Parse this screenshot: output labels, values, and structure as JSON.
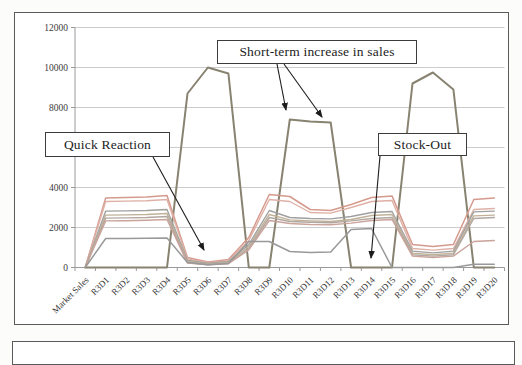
{
  "chart_data": {
    "type": "line",
    "title": "",
    "xlabel": "",
    "ylabel": "",
    "ylim": [
      0,
      12000
    ],
    "ytick_interval": 2000,
    "ytick_labels": [
      "0",
      "2000",
      "4000",
      "6000",
      "8000",
      "10000",
      "12000"
    ],
    "grid": "horizontal",
    "legend": "none",
    "categories": [
      "Market Sales",
      "R3D1",
      "R3D2",
      "R3D3",
      "R3D4",
      "R3D5",
      "R3D6",
      "R3D7",
      "R3D8",
      "R3D9",
      "R3D10",
      "R3D11",
      "R3D12",
      "R3D13",
      "R3D14",
      "R3D15",
      "R3D16",
      "R3D17",
      "R3D18",
      "R3D19",
      "R3D20"
    ],
    "series": [
      {
        "name": "promo-spike",
        "color": "#878370",
        "width": 2,
        "values": [
          0,
          0,
          0,
          0,
          0,
          8700,
          10000,
          9700,
          0,
          0,
          7400,
          7300,
          7250,
          0,
          0,
          0,
          9200,
          9750,
          8900,
          0,
          0
        ]
      },
      {
        "name": "top-salmon",
        "color": "#d59a8d",
        "width": 1.5,
        "values": [
          0,
          3480,
          3500,
          3530,
          3600,
          500,
          280,
          400,
          1500,
          3650,
          3550,
          2900,
          2850,
          3150,
          3500,
          3580,
          1150,
          1050,
          1150,
          3400,
          3480
        ]
      },
      {
        "name": "light-salmon",
        "color": "#dfb1a6",
        "width": 1.4,
        "values": [
          0,
          3300,
          3320,
          3340,
          3400,
          430,
          240,
          340,
          1350,
          3400,
          3300,
          2750,
          2720,
          3000,
          3300,
          3350,
          950,
          870,
          950,
          2900,
          2950
        ]
      },
      {
        "name": "gray-1",
        "color": "#a0a0a0",
        "width": 1.4,
        "values": [
          0,
          2820,
          2830,
          2850,
          2900,
          360,
          200,
          300,
          1150,
          2850,
          2500,
          2450,
          2430,
          2550,
          2750,
          2800,
          820,
          730,
          820,
          2780,
          2820
        ]
      },
      {
        "name": "tan-1",
        "color": "#c0b197",
        "width": 1.4,
        "values": [
          0,
          2620,
          2630,
          2650,
          2700,
          310,
          170,
          260,
          1050,
          2650,
          2380,
          2330,
          2300,
          2400,
          2600,
          2650,
          720,
          640,
          720,
          2580,
          2620
        ]
      },
      {
        "name": "warm-gray",
        "color": "#b2a7a0",
        "width": 1.4,
        "values": [
          0,
          2470,
          2480,
          2500,
          2550,
          260,
          150,
          220,
          950,
          2500,
          2300,
          2260,
          2240,
          2330,
          2450,
          2500,
          640,
          570,
          640,
          2450,
          2500
        ]
      },
      {
        "name": "pink-2",
        "color": "#caa39b",
        "width": 1.4,
        "values": [
          0,
          2330,
          2340,
          2360,
          2400,
          220,
          130,
          190,
          880,
          2350,
          2200,
          2150,
          2140,
          2220,
          2350,
          2400,
          570,
          500,
          570,
          1300,
          1350
        ]
      },
      {
        "name": "stockout-line",
        "color": "#999999",
        "width": 1.5,
        "values": [
          0,
          1450,
          1450,
          1460,
          1470,
          250,
          140,
          200,
          1300,
          1300,
          800,
          750,
          780,
          1900,
          1950,
          0,
          0,
          0,
          0,
          160,
          160
        ]
      }
    ],
    "annotations": [
      {
        "label": "Quick Reaction",
        "points_to": "R3D6 low sales dip"
      },
      {
        "label": "Short-term increase in sales",
        "points_to": "R3D10-R3D12 peak"
      },
      {
        "label": "Stock-Out",
        "points_to": "R3D14 zero level"
      }
    ]
  },
  "annotations": {
    "quick_reaction": {
      "label": "Quick Reaction"
    },
    "short_term": {
      "label": "Short-term increase in sales"
    },
    "stock_out": {
      "label": "Stock-Out"
    }
  }
}
